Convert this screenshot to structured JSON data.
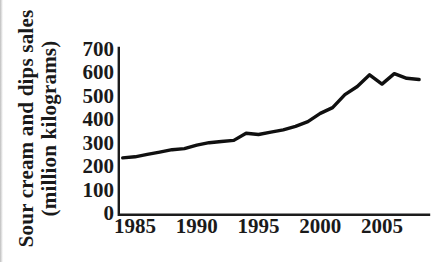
{
  "figure": {
    "background_color": "#ffffff",
    "ink_color": "#1a1a1a",
    "line_color": "#101010"
  },
  "chart_data": {
    "type": "line",
    "title": "",
    "xlabel": "",
    "ylabel": "Sour cream and dips sales (million kilograms)",
    "ylabel_line1": "Sour cream and dips sales",
    "ylabel_line2": "(million kilograms)",
    "series_name": "Sour cream and dips sales",
    "x": [
      1984,
      1985,
      1986,
      1987,
      1988,
      1989,
      1990,
      1991,
      1992,
      1993,
      1994,
      1995,
      1996,
      1997,
      1998,
      1999,
      2000,
      2001,
      2002,
      2003,
      2004,
      2005,
      2006,
      2007,
      2008
    ],
    "values": [
      235,
      240,
      250,
      260,
      270,
      275,
      290,
      300,
      305,
      310,
      340,
      335,
      345,
      355,
      370,
      390,
      425,
      450,
      505,
      540,
      590,
      550,
      595,
      575,
      570
    ],
    "xticks": [
      1985,
      1990,
      1995,
      2000,
      2005
    ],
    "yticks": [
      0,
      100,
      200,
      300,
      400,
      500,
      600,
      700
    ],
    "xlim": [
      1983.7,
      2009
    ],
    "ylim": [
      0,
      700
    ],
    "grid": false,
    "legend": "none"
  }
}
